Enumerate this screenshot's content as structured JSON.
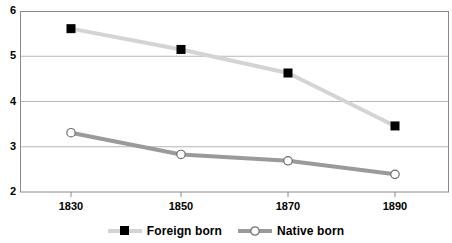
{
  "chart_data": {
    "type": "line",
    "title": "",
    "xlabel": "",
    "ylabel": "",
    "categories": [
      "1830",
      "1850",
      "1870",
      "1890"
    ],
    "x": [
      1830,
      1850,
      1870,
      1890
    ],
    "ylim": [
      2,
      6
    ],
    "yticks": [
      "2",
      "3",
      "4",
      "5",
      "6"
    ],
    "grid": true,
    "legend_position": "bottom",
    "series": [
      {
        "name": "Foreign born",
        "values": [
          5.61,
          5.15,
          4.63,
          3.46
        ],
        "color": "#d4d4d4",
        "marker": "filled-square",
        "marker_color": "#000000"
      },
      {
        "name": "Native born",
        "values": [
          3.31,
          2.83,
          2.69,
          2.39
        ],
        "color": "#9a9a9a",
        "marker": "open-circle",
        "marker_color": "#ffffff"
      }
    ]
  },
  "axes": {
    "y_tick_labels": [
      "6",
      "5",
      "4",
      "3",
      "2"
    ],
    "x_tick_labels": [
      "1830",
      "1850",
      "1870",
      "1890"
    ]
  },
  "legend": {
    "items": [
      {
        "label": "Foreign born"
      },
      {
        "label": "Native born"
      }
    ]
  },
  "title_remnant": {
    "text": ""
  },
  "colors": {
    "foreign_line": "#d4d4d4",
    "native_line": "#9a9a9a",
    "grid": "#b6b6b6",
    "axis": "#8a8a8a",
    "text": "#000000"
  }
}
